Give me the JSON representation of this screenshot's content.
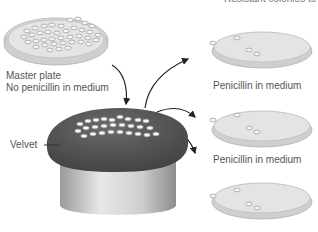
{
  "diagram": {
    "title_clipped": "Resistant colonies to grow",
    "master_plate": {
      "label_line1": "Master plate",
      "label_line2": "No penicillin in medium"
    },
    "velvet_label": "Velvet",
    "replica_plates": [
      {
        "label": "Penicillin in medium"
      },
      {
        "label": "Penicillin in medium"
      },
      {
        "label": ""
      }
    ],
    "colors": {
      "velvet": "#5a5a5a",
      "plate_rim": "#d4d4d4",
      "plate_medium": "#e2e2e2",
      "colony": "#f4f4f4",
      "arrow": "#222222",
      "text": "#555555"
    }
  }
}
